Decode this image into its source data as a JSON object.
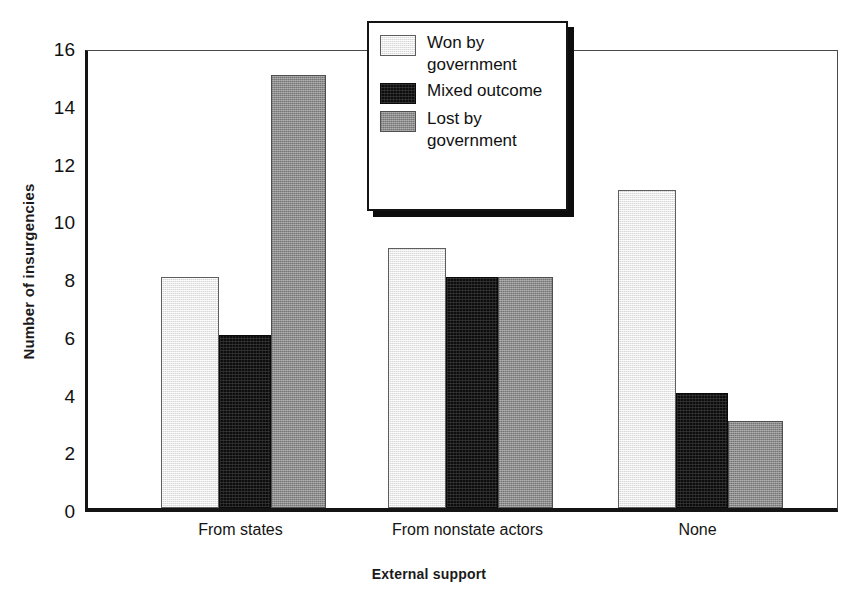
{
  "chart_data": {
    "type": "bar",
    "title": "",
    "xlabel": "External support",
    "ylabel": "Number of insurgencies",
    "categories": [
      "From states",
      "From nonstate actors",
      "None"
    ],
    "series": [
      {
        "name": "Won by government",
        "values": [
          8,
          9,
          11
        ],
        "color": "#d6d6d6",
        "swatch": "light-gray-dither"
      },
      {
        "name": "Mixed outcome",
        "values": [
          6,
          8,
          4
        ],
        "color": "#0d0d0d",
        "swatch": "black-dither"
      },
      {
        "name": "Lost by government",
        "values": [
          15,
          8,
          3
        ],
        "color": "#8d8d8d",
        "swatch": "medium-gray-dither"
      }
    ],
    "ylim": [
      0,
      16
    ],
    "yticks": [
      0,
      2,
      4,
      6,
      8,
      10,
      12,
      14,
      16
    ],
    "ytick_labels": [
      "0",
      "2",
      "4",
      "6",
      "8",
      "10",
      "12",
      "14",
      "16"
    ],
    "grid": false,
    "legend_position": "top-center"
  },
  "legend": {
    "entries": [
      {
        "label": "Won by government"
      },
      {
        "label": "Mixed outcome"
      },
      {
        "label": "Lost by government"
      }
    ]
  }
}
